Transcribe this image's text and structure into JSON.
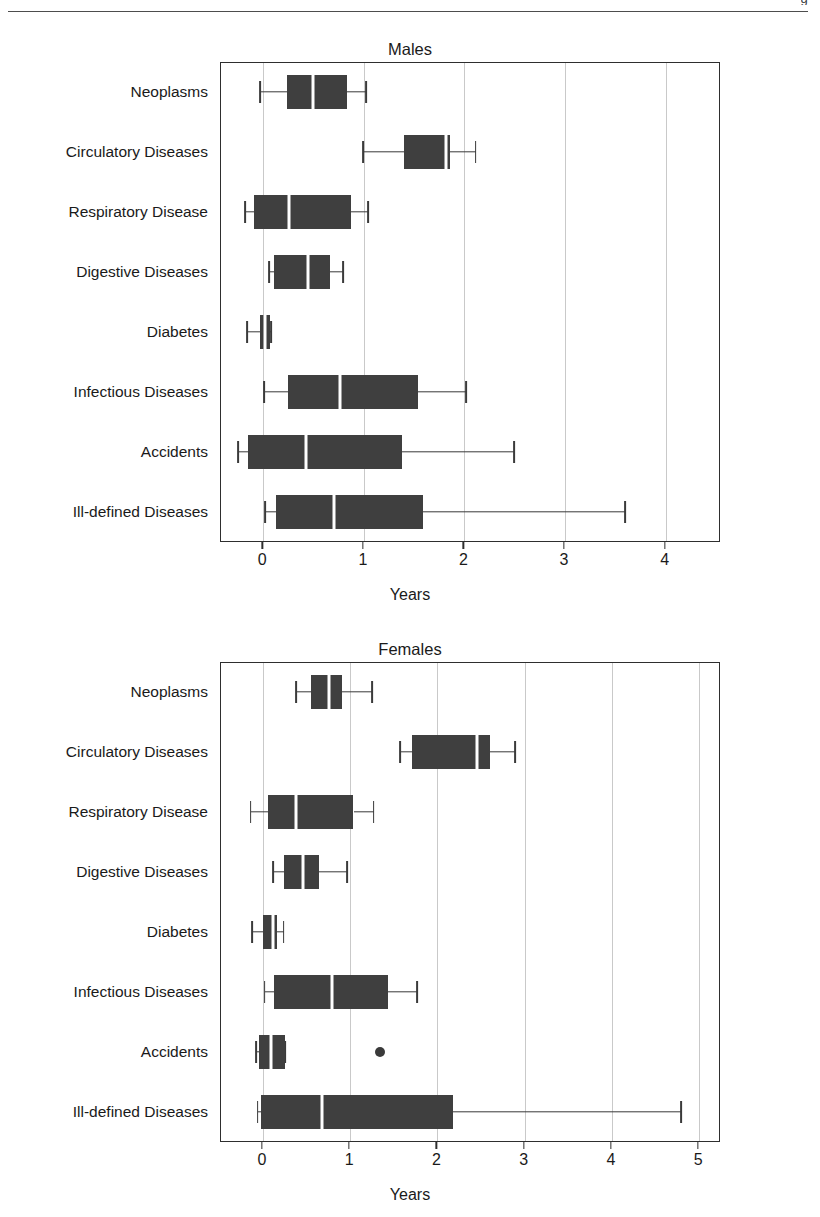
{
  "page": {
    "header_fragment": "g"
  },
  "chart_data": [
    {
      "type": "boxplot",
      "title": "Males",
      "xlabel": "Years",
      "ylabel": "",
      "xlim": [
        -0.42,
        4.55
      ],
      "xticks": [
        0,
        1,
        2,
        3,
        4
      ],
      "xticklabels": [
        "0",
        "1",
        "2",
        "3",
        "4"
      ],
      "grid": true,
      "orientation": "horizontal",
      "categories": [
        "Neoplasms",
        "Circulatory Diseases",
        "Respiratory Disease",
        "Digestive Diseases",
        "Diabetes",
        "Infectious Diseases",
        "Accidents",
        "Ill-defined Diseases"
      ],
      "boxes": [
        {
          "category": "Neoplasms",
          "whisker_low": -0.02,
          "q1": 0.25,
          "median": 0.5,
          "q3": 0.84,
          "whisker_high": 1.03,
          "outliers": []
        },
        {
          "category": "Circulatory Diseases",
          "whisker_low": 1.0,
          "q1": 1.41,
          "median": 1.83,
          "q3": 1.87,
          "whisker_high": 2.12,
          "outliers": []
        },
        {
          "category": "Respiratory Disease",
          "whisker_low": -0.17,
          "q1": -0.08,
          "median": 0.27,
          "q3": 0.88,
          "whisker_high": 1.05,
          "outliers": []
        },
        {
          "category": "Digestive Diseases",
          "whisker_low": 0.07,
          "q1": 0.12,
          "median": 0.45,
          "q3": 0.67,
          "whisker_high": 0.8,
          "outliers": []
        },
        {
          "category": "Diabetes",
          "whisker_low": -0.15,
          "q1": -0.02,
          "median": 0.03,
          "q3": 0.08,
          "whisker_high": 0.09,
          "outliers": []
        },
        {
          "category": "Infectious Diseases",
          "whisker_low": 0.02,
          "q1": 0.26,
          "median": 0.77,
          "q3": 1.55,
          "whisker_high": 2.03,
          "outliers": []
        },
        {
          "category": "Accidents",
          "whisker_low": -0.24,
          "q1": -0.14,
          "median": 0.43,
          "q3": 1.39,
          "whisker_high": 2.5,
          "outliers": []
        },
        {
          "category": "Ill-defined Diseases",
          "whisker_low": 0.03,
          "q1": 0.14,
          "median": 0.71,
          "q3": 1.6,
          "whisker_high": 3.61,
          "outliers": []
        }
      ]
    },
    {
      "type": "boxplot",
      "title": "Females",
      "xlabel": "Years",
      "ylabel": "",
      "xlim": [
        -0.48,
        5.25
      ],
      "xticks": [
        0,
        1,
        2,
        3,
        4,
        5
      ],
      "xticklabels": [
        "0",
        "1",
        "2",
        "3",
        "4",
        "5"
      ],
      "grid": true,
      "orientation": "horizontal",
      "categories": [
        "Neoplasms",
        "Circulatory Diseases",
        "Respiratory Disease",
        "Digestive Diseases",
        "Diabetes",
        "Infectious Diseases",
        "Accidents",
        "Ill-defined Diseases"
      ],
      "boxes": [
        {
          "category": "Neoplasms",
          "whisker_low": 0.39,
          "q1": 0.56,
          "median": 0.77,
          "q3": 0.92,
          "whisker_high": 1.26,
          "outliers": []
        },
        {
          "category": "Circulatory Diseases",
          "whisker_low": 1.58,
          "q1": 1.72,
          "median": 2.47,
          "q3": 2.61,
          "whisker_high": 2.9,
          "outliers": []
        },
        {
          "category": "Respiratory Disease",
          "whisker_low": -0.13,
          "q1": 0.07,
          "median": 0.39,
          "q3": 1.05,
          "whisker_high": 1.28,
          "outliers": []
        },
        {
          "category": "Digestive Diseases",
          "whisker_low": 0.13,
          "q1": 0.25,
          "median": 0.47,
          "q3": 0.65,
          "whisker_high": 0.98,
          "outliers": []
        },
        {
          "category": "Diabetes",
          "whisker_low": -0.11,
          "q1": 0.01,
          "median": 0.13,
          "q3": 0.17,
          "whisker_high": 0.25,
          "outliers": []
        },
        {
          "category": "Infectious Diseases",
          "whisker_low": 0.03,
          "q1": 0.14,
          "median": 0.8,
          "q3": 1.45,
          "whisker_high": 1.78,
          "outliers": []
        },
        {
          "category": "Accidents",
          "whisker_low": -0.07,
          "q1": -0.03,
          "median": 0.1,
          "q3": 0.27,
          "whisker_high": 0.27,
          "outliers": [
            1.35
          ]
        },
        {
          "category": "Ill-defined Diseases",
          "whisker_low": -0.05,
          "q1": -0.01,
          "median": 0.69,
          "q3": 2.19,
          "whisker_high": 4.8,
          "outliers": []
        }
      ]
    }
  ]
}
